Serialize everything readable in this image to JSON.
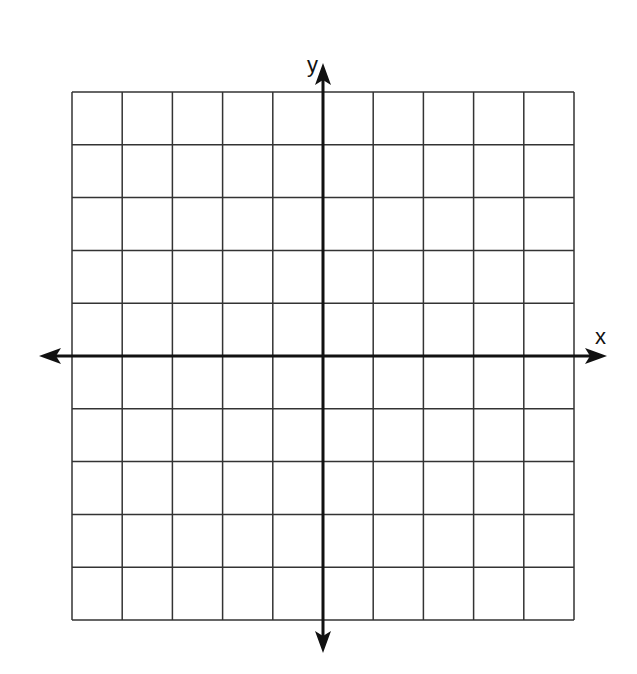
{
  "diagram": {
    "type": "coordinate-plane",
    "grid": {
      "columns": 10,
      "rows": 10,
      "left": 72,
      "top": 92,
      "right": 574,
      "bottom": 620,
      "line_color": "#333333",
      "line_width": 1.5
    },
    "axes": {
      "origin_column_index": 5,
      "origin_row_index": 5,
      "color": "#111111",
      "width": 3,
      "x_axis": {
        "label": "x",
        "from": 39,
        "to": 607
      },
      "y_axis": {
        "label": "y",
        "from": 653,
        "to": 63
      }
    },
    "background": "#ffffff"
  }
}
